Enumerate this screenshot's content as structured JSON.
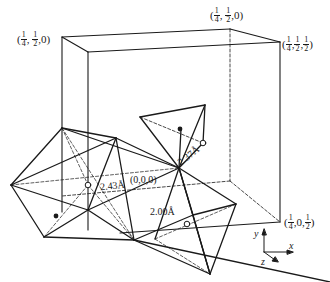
{
  "figure": {
    "type": "crystal-structure-diagram",
    "corner_labels": [
      {
        "id": "top-left",
        "text": "(1/4, 1/2, 0)",
        "parts": [
          "(",
          "1",
          "4",
          ",",
          "1",
          "2",
          ",0)"
        ],
        "x": 14,
        "y": 31
      },
      {
        "id": "top-back",
        "text": "(1/4, 1/2, 0)",
        "parts": [
          "(",
          "1",
          "4",
          ",",
          "1",
          "2",
          ",0)"
        ],
        "x": 210,
        "y": 13
      },
      {
        "id": "top-right",
        "text": "(1/4, 1/2, 1/2)",
        "x": 284,
        "y": 36
      },
      {
        "id": "bottom-right",
        "text": "(1/4, 0, 1/2)",
        "x": 284,
        "y": 215
      }
    ],
    "origin_label": "(0,0,0)",
    "distances": [
      {
        "id": "d1",
        "text": "2.43Å",
        "x": 100,
        "y": 180,
        "rotate": -6
      },
      {
        "id": "d2",
        "text": "2.37Å",
        "x": 176,
        "y": 152,
        "rotate": -38
      },
      {
        "id": "d3",
        "text": "2.00Å",
        "x": 150,
        "y": 207,
        "rotate": 0
      }
    ],
    "axes": {
      "x": "x",
      "y": "y",
      "z": "z"
    },
    "colors": {
      "line": "#1a1a1a",
      "background": "#ffffff"
    }
  }
}
